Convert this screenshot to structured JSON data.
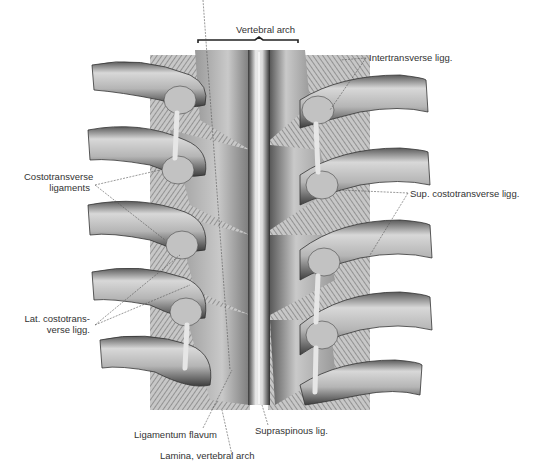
{
  "figure": {
    "title_bracket_label": "Vertebral arch",
    "labels": {
      "vertebral_arch": "Vertebral arch",
      "intertransverse": "Intertransverse ligg.",
      "costotransverse_line1": "Costotransverse",
      "costotransverse_line2": "ligaments",
      "sup_costotransverse": "Sup. costotransverse ligg.",
      "lat_costotransverse_line1": "Lat. costotrans-",
      "lat_costotransverse_line2": "verse ligg.",
      "ligamentum_flavum": "Ligamentum flavum",
      "supraspinous": "Supraspinous lig.",
      "lamina": "Lamina, vertebral arch"
    },
    "colors": {
      "background": "#ffffff",
      "bone_light": "#d9d9d9",
      "bone_mid": "#a8a8a8",
      "bone_dark": "#4a4a4a",
      "ink": "#222222"
    }
  }
}
